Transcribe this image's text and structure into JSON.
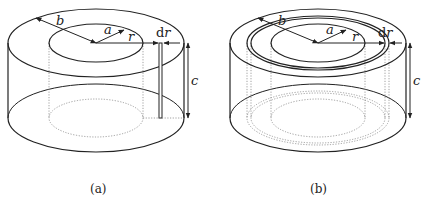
{
  "figures": [
    {
      "id": "a",
      "caption": "(a)",
      "labels": {
        "outer_radius": "b",
        "inner_radius": "a",
        "radius": "r",
        "thickness_d": "d",
        "thickness_r": "r",
        "height": "c"
      },
      "description": "Cylindrical annulus with inner radius a, outer radius b, height c; thin vertical strip at radius r of width dr"
    },
    {
      "id": "b",
      "caption": "(b)",
      "labels": {
        "outer_radius": "b",
        "inner_radius": "a",
        "radius": "r",
        "thickness_d": "d",
        "thickness_r": "r",
        "height": "c"
      },
      "description": "Cylindrical annulus with a thin cylindrical shell of radius r and thickness dr"
    }
  ],
  "colors": {
    "stroke": "#222222",
    "dotted": "#888888",
    "background": "#ffffff"
  }
}
